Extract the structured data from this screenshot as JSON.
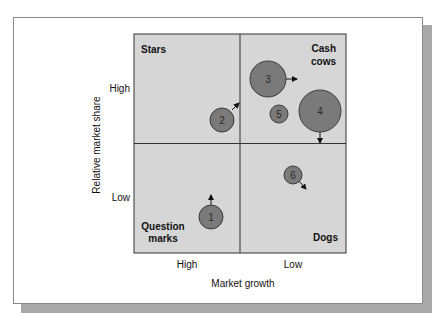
{
  "diagram": {
    "type": "BCG growth-share matrix",
    "quadrants": {
      "top_left": "Stars",
      "top_right_line1": "Cash",
      "top_right_line2": "cows",
      "bottom_left_line1": "Question",
      "bottom_left_line2": "marks",
      "bottom_right": "Dogs"
    },
    "y_axis": {
      "title": "Relative market share",
      "ticks": [
        "High",
        "Low"
      ]
    },
    "x_axis": {
      "title": "Market growth",
      "ticks": [
        "High",
        "Low"
      ]
    },
    "bubbles": [
      {
        "id": "1",
        "label": "1",
        "quadrant": "Question marks",
        "size": "small-medium",
        "arrow": "up"
      },
      {
        "id": "2",
        "label": "2",
        "quadrant": "Stars",
        "size": "small-medium",
        "arrow": "up-right"
      },
      {
        "id": "3",
        "label": "3",
        "quadrant": "Cash cows",
        "size": "large",
        "arrow": "right"
      },
      {
        "id": "4",
        "label": "4",
        "quadrant": "Cash cows",
        "size": "largest",
        "arrow": "down"
      },
      {
        "id": "5",
        "label": "5",
        "quadrant": "Cash cows",
        "size": "small",
        "arrow": "none"
      },
      {
        "id": "6",
        "label": "6",
        "quadrant": "Dogs",
        "size": "small",
        "arrow": "down-right"
      }
    ],
    "colors": {
      "grid_fill": "#d6d6d6",
      "grid_line": "#333333",
      "bubble_fill": "#7a7a7a",
      "bubble_stroke": "#3a3a3a",
      "shadow": "#a9a9a9"
    }
  }
}
